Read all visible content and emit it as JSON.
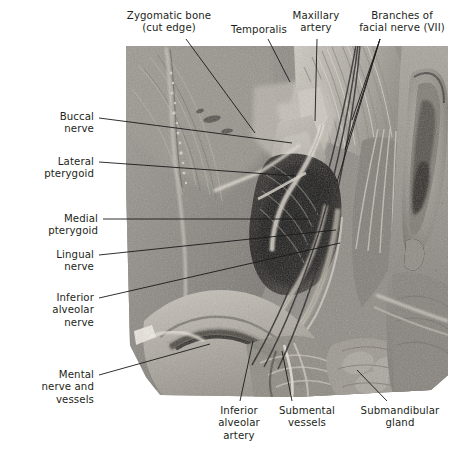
{
  "figure": {
    "type": "anatomical-dissection-photograph",
    "region": "Infratemporal fossa / mandible — lateral dissection of the face",
    "orientation": "left lateral view, anterior to the left",
    "photo_style": "grayscale cadaveric dissection photograph",
    "background_color": "#ffffff",
    "label_color": "#231f20",
    "leader_line_color": "#1a1a1a"
  },
  "labels": [
    {
      "id": "zygomatic-bone",
      "text": "Zygomatic bone\n(cut edge)",
      "align": "center",
      "x": 115,
      "y": 10,
      "width": 108,
      "leader": [
        [
          186,
          39
        ],
        [
          255,
          133
        ]
      ]
    },
    {
      "id": "temporalis",
      "text": "Temporalis",
      "align": "center",
      "x": 226,
      "y": 24,
      "width": 66,
      "leader": [
        [
          268,
          39
        ],
        [
          290,
          82
        ]
      ]
    },
    {
      "id": "maxillary-artery",
      "text": "Maxillary\nartery",
      "align": "center",
      "x": 287,
      "y": 10,
      "width": 58,
      "leader": [
        [
          317,
          39
        ],
        [
          315,
          121
        ]
      ]
    },
    {
      "id": "branches-facial-nerve",
      "text": "Branches of\nfacial nerve (VII)",
      "align": "center",
      "x": 352,
      "y": 10,
      "width": 96,
      "leader": [
        [
          380,
          39
        ],
        [
          354,
          128
        ]
      ]
    },
    {
      "id": "buccal-nerve",
      "text": "Buccal\nnerve",
      "align": "right",
      "x": 22,
      "y": 111,
      "width": 72,
      "leader": [
        [
          99,
          118
        ],
        [
          292,
          143
        ]
      ]
    },
    {
      "id": "lateral-pterygoid",
      "text": "Lateral\npterygoid",
      "align": "right",
      "x": 16,
      "y": 156,
      "width": 78,
      "leader": [
        [
          99,
          162
        ],
        [
          296,
          175
        ]
      ]
    },
    {
      "id": "medial-pterygoid",
      "text": "Medial\npterygoid",
      "align": "right",
      "x": 16,
      "y": 213,
      "width": 78,
      "leader": [
        [
          103,
          219
        ],
        [
          308,
          219
        ]
      ]
    },
    {
      "id": "lingual-nerve",
      "text": "Lingual\nnerve",
      "align": "right",
      "x": 22,
      "y": 249,
      "width": 72,
      "leader": [
        [
          99,
          255
        ],
        [
          330,
          230
        ]
      ]
    },
    {
      "id": "inferior-alveolar-nerve",
      "text": "Inferior\nalveolar\nnerve",
      "align": "right",
      "x": 22,
      "y": 292,
      "width": 72,
      "leader": [
        [
          99,
          298
        ],
        [
          336,
          242
        ]
      ]
    },
    {
      "id": "mental-nerve-and-vessels",
      "text": "Mental\nnerve and\nvessels",
      "align": "right",
      "x": 14,
      "y": 369,
      "width": 80,
      "leader": [
        [
          99,
          375
        ],
        [
          212,
          345
        ]
      ]
    },
    {
      "id": "inferior-alveolar-artery",
      "text": "Inferior\nalveolar\nartery",
      "align": "center",
      "x": 208,
      "y": 405,
      "width": 56,
      "leader": [
        [
          240,
          402
        ],
        [
          252,
          342
        ]
      ]
    },
    {
      "id": "submental-vessels",
      "text": "Submental\nvessels",
      "align": "center",
      "x": 268,
      "y": 405,
      "width": 70,
      "leader": [
        [
          292,
          402
        ],
        [
          282,
          352
        ]
      ]
    },
    {
      "id": "submandibular-gland",
      "text": "Submandibular\ngland",
      "align": "center",
      "x": 352,
      "y": 405,
      "width": 96,
      "leader": [
        [
          387,
          402
        ],
        [
          358,
          371
        ]
      ]
    }
  ]
}
